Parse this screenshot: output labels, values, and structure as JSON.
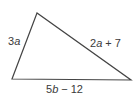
{
  "figure": {
    "type": "triangle",
    "stroke_color": "#444444",
    "vertices": {
      "top": [
        37,
        13
      ],
      "bottom_left": [
        12,
        79
      ],
      "bottom_right": [
        131,
        80
      ]
    },
    "sides": {
      "left": {
        "coef": "3",
        "var": "a",
        "op": "",
        "const": ""
      },
      "right": {
        "coef": "2",
        "var": "a",
        "op": "+",
        "const": "7"
      },
      "bottom": {
        "coef": "5",
        "var": "b",
        "op": "−",
        "const": "12"
      }
    }
  }
}
